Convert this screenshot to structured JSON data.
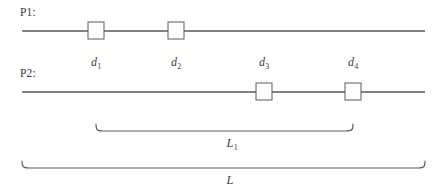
{
  "figure": {
    "background_color": "#ffffff",
    "stroke_color": "#5a5a5a",
    "text_color": "#3a3a3a",
    "width": 445,
    "height": 196
  },
  "paths": [
    {
      "id": "p1",
      "label": "P1:",
      "label_x": 20,
      "label_y": 6,
      "line_y": 31,
      "line_x1": 22,
      "line_x2": 425,
      "markers": [
        {
          "name": "marker-d1",
          "cx": 96,
          "size": 16
        },
        {
          "name": "marker-d2",
          "cx": 176,
          "size": 16
        }
      ]
    },
    {
      "id": "p2",
      "label": "P2:",
      "label_x": 20,
      "label_y": 67,
      "line_y": 92,
      "line_x1": 22,
      "line_x2": 425,
      "markers": [
        {
          "name": "marker-d3",
          "cx": 264,
          "size": 16
        },
        {
          "name": "marker-d4",
          "cx": 353,
          "size": 16
        }
      ]
    }
  ],
  "distance_labels": [
    {
      "name": "distance-label-d1",
      "base": "d",
      "sub": "1",
      "x": 96,
      "y": 55
    },
    {
      "name": "distance-label-d2",
      "base": "d",
      "sub": "2",
      "x": 176,
      "y": 55
    },
    {
      "name": "distance-label-d3",
      "base": "d",
      "sub": "3",
      "x": 264,
      "y": 55
    },
    {
      "name": "distance-label-d4",
      "base": "d",
      "sub": "4",
      "x": 353,
      "y": 55
    }
  ],
  "braces": [
    {
      "name": "brace-L1",
      "x1": 96,
      "x2": 353,
      "top_y": 124,
      "body_y": 131,
      "label_base": "L",
      "label_sub": "1",
      "label_x": 232,
      "label_y": 136
    },
    {
      "name": "brace-L",
      "x1": 22,
      "x2": 425,
      "top_y": 161,
      "body_y": 168,
      "label_base": "L",
      "label_sub": "",
      "label_x": 230,
      "label_y": 173
    }
  ]
}
